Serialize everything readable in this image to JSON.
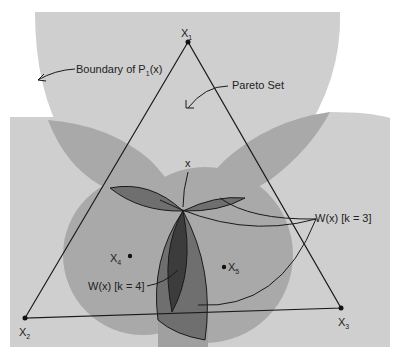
{
  "diagram": {
    "vertices": [
      {
        "name": "X1",
        "label": "X",
        "sub": "1",
        "x": 188,
        "y": 42
      },
      {
        "name": "X2",
        "label": "X",
        "sub": "2",
        "x": 25,
        "y": 318
      },
      {
        "name": "X3",
        "label": "X",
        "sub": "3",
        "x": 341,
        "y": 308
      }
    ],
    "points": [
      {
        "name": "x",
        "label": "x",
        "x": 183,
        "y": 211
      },
      {
        "name": "X4",
        "label": "X",
        "sub": "4",
        "x": 130,
        "y": 256
      },
      {
        "name": "X5",
        "label": "X",
        "sub": "5",
        "x": 224,
        "y": 267
      }
    ],
    "annotations": {
      "boundary": {
        "text_pre": "Boundary of P",
        "sub": "1",
        "text_post": "(x)"
      },
      "pareto": "Pareto Set",
      "w3": "W(x) [k = 3]",
      "w4": "W(x) [k = 4]"
    },
    "colors": {
      "background": "#ffffff",
      "region_light": "#cfcfcf",
      "region_mid": "#a9a9a9",
      "region_dark": "#6f6f6f",
      "region_darkest": "#3c3c3c",
      "line": "#1a1a1a"
    }
  }
}
